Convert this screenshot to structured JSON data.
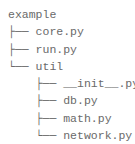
{
  "tree": {
    "root": "example",
    "rows": [
      {
        "prefix": "├── ",
        "name": "core.py"
      },
      {
        "prefix": "├── ",
        "name": "run.py"
      },
      {
        "prefix": "└── ",
        "name": "util"
      },
      {
        "prefix": "    ├── ",
        "name": "__init__.py"
      },
      {
        "prefix": "    ├── ",
        "name": "db.py"
      },
      {
        "prefix": "    ├── ",
        "name": "math.py"
      },
      {
        "prefix": "    └── ",
        "name": "network.py"
      }
    ]
  }
}
